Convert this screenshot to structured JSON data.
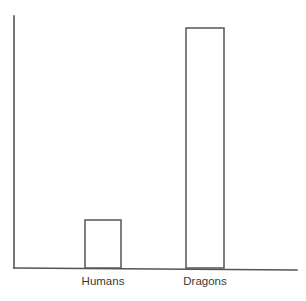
{
  "chart_data": {
    "type": "bar",
    "title": "",
    "subtitle": "",
    "xlabel": "",
    "ylabel": "",
    "categories": [
      "Humans",
      "Dragons"
    ],
    "values": [
      1,
      5
    ],
    "ylim": [
      0,
      5.25
    ],
    "grid": false,
    "legend": false,
    "legend_position": "none",
    "annotations": [],
    "style": {
      "bar_fill": "#ffffff",
      "bar_stroke": "#555555",
      "axis_color": "#555555",
      "label_color": "#3a3a3a",
      "background": "#ffffff"
    },
    "tick_labels": {
      "x": [
        "Humans",
        "Dragons"
      ],
      "y": []
    }
  },
  "axes": {
    "y_axis_name": "value-axis",
    "x_axis_name": "category-axis"
  }
}
